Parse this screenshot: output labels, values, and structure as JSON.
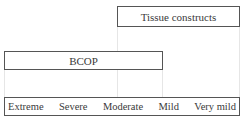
{
  "diagram": {
    "ranges": [
      {
        "label": "Tissue constructs",
        "from": "Moderate",
        "to": "Very mild"
      },
      {
        "label": "BCOP",
        "from": "Extreme",
        "to": "Mild"
      }
    ],
    "scale": {
      "levels": [
        "Extreme",
        "Severe",
        "Moderate",
        "Mild",
        "Very mild"
      ]
    }
  }
}
